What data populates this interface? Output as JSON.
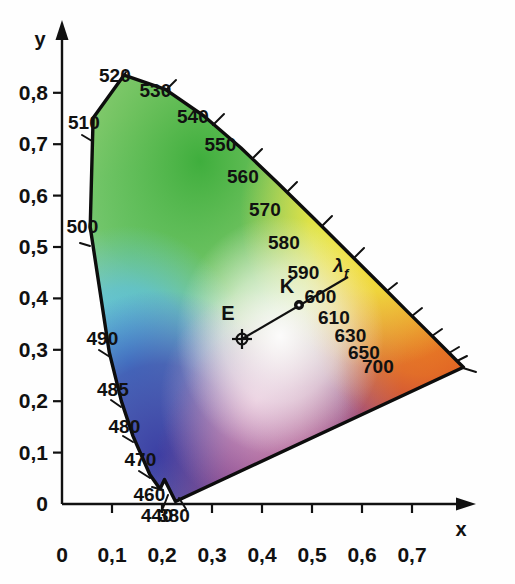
{
  "figure": {
    "type": "cie-chromaticity-diagram",
    "background_color": "#fefefe",
    "line_color": "#111111"
  },
  "axes": {
    "x_axis_label": "x",
    "y_axis_label": "y",
    "x_ticks": [
      "0",
      "0,1",
      "0,2",
      "0,3",
      "0,4",
      "0,5",
      "0,6",
      "0,7"
    ],
    "y_ticks": [
      "0",
      "0,1",
      "0,2",
      "0,3",
      "0,4",
      "0,5",
      "0,6",
      "0,7",
      "0,8"
    ],
    "x_range": [
      0,
      0.8
    ],
    "y_range": [
      0,
      0.9
    ],
    "decimal_separator": ","
  },
  "wavelength_labels": [
    {
      "text": "520",
      "x": 0.074,
      "y": 0.834
    },
    {
      "text": "530",
      "x": 0.155,
      "y": 0.806
    },
    {
      "text": "540",
      "x": 0.23,
      "y": 0.754
    },
    {
      "text": "550",
      "x": 0.285,
      "y": 0.7
    },
    {
      "text": "560",
      "x": 0.33,
      "y": 0.638
    },
    {
      "text": "570",
      "x": 0.374,
      "y": 0.574
    },
    {
      "text": "580",
      "x": 0.412,
      "y": 0.51
    },
    {
      "text": "590",
      "x": 0.451,
      "y": 0.452
    },
    {
      "text": "600",
      "x": 0.485,
      "y": 0.404
    },
    {
      "text": "610",
      "x": 0.512,
      "y": 0.364
    },
    {
      "text": "630",
      "x": 0.545,
      "y": 0.328
    },
    {
      "text": "650",
      "x": 0.572,
      "y": 0.296
    },
    {
      "text": "700",
      "x": 0.6,
      "y": 0.268
    },
    {
      "text": "510",
      "x": 0.012,
      "y": 0.744
    },
    {
      "text": "500",
      "x": 0.009,
      "y": 0.54
    },
    {
      "text": "490",
      "x": 0.049,
      "y": 0.323
    },
    {
      "text": "485",
      "x": 0.07,
      "y": 0.223
    },
    {
      "text": "480",
      "x": 0.093,
      "y": 0.151
    },
    {
      "text": "470",
      "x": 0.125,
      "y": 0.087
    },
    {
      "text": "460",
      "x": 0.143,
      "y": 0.02
    },
    {
      "text": "440",
      "x": 0.158,
      "y": -0.022
    },
    {
      "text": "380",
      "x": 0.192,
      "y": -0.022
    }
  ],
  "points": [
    {
      "name": "E",
      "label": "E",
      "marker": "crosshair-circle",
      "x": 0.352,
      "y": 0.34
    },
    {
      "name": "K",
      "label": "K",
      "marker": "dot",
      "x": 0.465,
      "y": 0.41
    }
  ],
  "annotations": [
    {
      "name": "lambda-f",
      "label": "λ",
      "subscript": "f",
      "x": 0.545,
      "y": 0.492
    }
  ],
  "mixing_line": {
    "from": "E",
    "through": "K",
    "to_wavelength": "580",
    "end_x": 0.573,
    "end_y": 0.462
  },
  "chart_data": {
    "type": "scatter",
    "title": "",
    "xlabel": "x",
    "ylabel": "y",
    "xlim": [
      0,
      0.8
    ],
    "ylim": [
      0,
      0.9
    ],
    "grid": false,
    "legend": "none",
    "series": [
      {
        "name": "spectral-locus",
        "kind": "curve",
        "points": [
          {
            "wavelength": 380,
            "x": 0.1741,
            "y": 0.005
          },
          {
            "wavelength": 440,
            "x": 0.1526,
            "y": 0.048
          },
          {
            "wavelength": 460,
            "x": 0.144,
            "y": 0.0297
          },
          {
            "wavelength": 470,
            "x": 0.1241,
            "y": 0.0578
          },
          {
            "wavelength": 480,
            "x": 0.0913,
            "y": 0.1327
          },
          {
            "wavelength": 485,
            "x": 0.0687,
            "y": 0.2007
          },
          {
            "wavelength": 490,
            "x": 0.0454,
            "y": 0.295
          },
          {
            "wavelength": 500,
            "x": 0.0082,
            "y": 0.5384
          },
          {
            "wavelength": 510,
            "x": 0.0139,
            "y": 0.7502
          },
          {
            "wavelength": 520,
            "x": 0.0743,
            "y": 0.8338
          },
          {
            "wavelength": 530,
            "x": 0.1547,
            "y": 0.8059
          },
          {
            "wavelength": 540,
            "x": 0.2296,
            "y": 0.7543
          },
          {
            "wavelength": 550,
            "x": 0.3016,
            "y": 0.6923
          },
          {
            "wavelength": 560,
            "x": 0.3731,
            "y": 0.6245
          },
          {
            "wavelength": 570,
            "x": 0.4441,
            "y": 0.5547
          },
          {
            "wavelength": 580,
            "x": 0.5125,
            "y": 0.4866
          },
          {
            "wavelength": 590,
            "x": 0.5752,
            "y": 0.4242
          },
          {
            "wavelength": 600,
            "x": 0.627,
            "y": 0.3725
          },
          {
            "wavelength": 610,
            "x": 0.6658,
            "y": 0.334
          },
          {
            "wavelength": 630,
            "x": 0.7079,
            "y": 0.292
          },
          {
            "wavelength": 650,
            "x": 0.719,
            "y": 0.2809
          },
          {
            "wavelength": 700,
            "x": 0.7347,
            "y": 0.2653
          }
        ]
      },
      {
        "name": "purple-line",
        "kind": "line",
        "points": [
          {
            "x": 0.7347,
            "y": 0.2653
          },
          {
            "x": 0.1741,
            "y": 0.005
          }
        ]
      },
      {
        "name": "mixing-line",
        "kind": "line",
        "points": [
          {
            "x": 0.352,
            "y": 0.34
          },
          {
            "x": 0.465,
            "y": 0.41
          },
          {
            "x": 0.573,
            "y": 0.462
          }
        ]
      }
    ]
  }
}
